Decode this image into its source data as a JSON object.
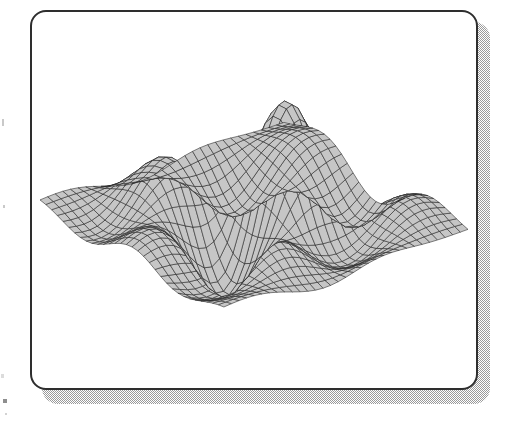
{
  "page": {
    "width": 509,
    "height": 427,
    "background_color": "#ffffff"
  },
  "frame": {
    "name": "figure-frame",
    "x": 30,
    "y": 10,
    "width": 448,
    "height": 380,
    "corner_radius": 16,
    "border_width": 2,
    "border_color": "#2e2e2e",
    "fill_color": "#ffffff"
  },
  "shadow": {
    "name": "frame-drop-shadow",
    "offset_x": 12,
    "offset_y": 12,
    "color": "#9a9a9a",
    "pattern": "50% checkerboard dither"
  },
  "chart_data": {
    "type": "surface",
    "title": "",
    "subtitle": "",
    "xlabel": "",
    "ylabel": "",
    "zlabel": "",
    "grid": true,
    "legend": false,
    "legend_position": "none",
    "render_style": "hidden-line-removed wireframe mesh with shaded facets",
    "facet_fill_color": "#c6c6c6",
    "mesh_line_color": "#1f1f1f",
    "mesh_line_width": 0.55,
    "surface_formula": "z = sin(pi*x) * cos(pi*y) * exp(-(x*x+y*y)/3.2) * 1.0 + 0.55*sin(1.7*pi*x)*exp(-((x-0.35)^2+(y+0.1)^2)/1.1)",
    "x_samples": 33,
    "y_samples": 33,
    "xlim": [
      -2.0,
      2.0
    ],
    "ylim": [
      -2.0,
      2.0
    ],
    "zlim": [
      -1.15,
      1.25
    ],
    "view": {
      "azimuth_deg": 37,
      "elevation_deg": 26,
      "projection": "parallel"
    },
    "features": [
      {
        "name": "principal-peak",
        "location": "upper-right-center",
        "screen_x": 322,
        "screen_y": 56,
        "relative_height": 1.0
      },
      {
        "name": "secondary-ridge",
        "location": "upper-left",
        "screen_x": 205,
        "screen_y": 92,
        "relative_height": 0.62
      },
      {
        "name": "central-cliff",
        "location": "center",
        "screen_x": 243,
        "screen_y": 160,
        "description": "steep near-vertical facet band with compressed grid lines"
      },
      {
        "name": "foreground-trough",
        "location": "lower-center",
        "screen_x": 268,
        "screen_y": 262,
        "relative_height": -0.85
      },
      {
        "name": "left-tip",
        "location": "left-edge",
        "screen_x": 62,
        "screen_y": 200
      },
      {
        "name": "right-tip",
        "location": "right-edge",
        "screen_x": 447,
        "screen_y": 150
      },
      {
        "name": "lower-left-lobe",
        "location": "bottom-left",
        "screen_x": 205,
        "screen_y": 318
      },
      {
        "name": "lower-right-lobe",
        "location": "bottom-right",
        "screen_x": 330,
        "screen_y": 312
      }
    ]
  }
}
